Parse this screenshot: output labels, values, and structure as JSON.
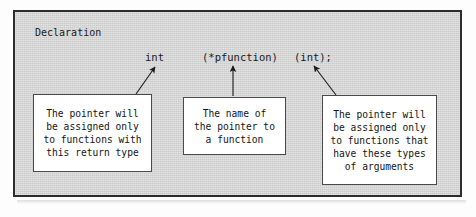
{
  "figure": {
    "caption": "Declaration",
    "frame_border_color": "#2d2d2d",
    "panel_background_color": "#d6d6d6",
    "callout_background_color": "#ffffff",
    "text_color": "#1a1a1a"
  },
  "declaration": {
    "parts": [
      {
        "name": "return-type",
        "text": "int"
      },
      {
        "name": "pointer-name",
        "text": "(*pfunction)"
      },
      {
        "name": "parameters",
        "text": "(int);"
      }
    ]
  },
  "callouts": [
    {
      "name": "return-type",
      "text": "The pointer will\nbe assigned only\nto functions with\nthis return type",
      "points_to": "int"
    },
    {
      "name": "pointer-name",
      "text": "The name of\nthe pointer to\na function",
      "points_to": "(*pfunction)"
    },
    {
      "name": "parameters",
      "text": "The pointer will\nbe assigned only\nto functions that\nhave these types\nof arguments",
      "points_to": "(int);"
    }
  ],
  "arrows": [
    {
      "name": "arrow-to-return-type",
      "direction": "diagonal-up-right"
    },
    {
      "name": "arrow-to-pointer-name",
      "direction": "vertical-up"
    },
    {
      "name": "arrow-to-parameters",
      "direction": "diagonal-up-left"
    }
  ]
}
